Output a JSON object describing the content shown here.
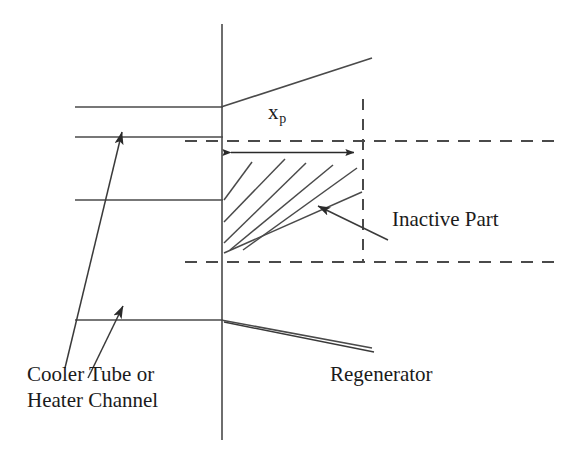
{
  "figure": {
    "kind": "engineering-schematic",
    "background_color": "#ffffff",
    "line_color": "#3a3a3a",
    "text_color": "#1b1b1b",
    "width": 579,
    "height": 460
  },
  "labels": {
    "xp_symbol": "x",
    "xp_subscript": "p",
    "inactive_part": "Inactive Part",
    "cooler_tube_line1": "Cooler Tube or",
    "cooler_tube_line2": "Heater Channel",
    "regenerator": "Regenerator"
  },
  "geometry": {
    "interface_line": {
      "x": 222,
      "y_top": 24,
      "y_bottom": 440
    },
    "channel_walls": [
      {
        "name": "wall-top-outer",
        "x1": 75,
        "y1": 107,
        "x2": 222,
        "y2": 107
      },
      {
        "name": "wall-top-inner",
        "x1": 75,
        "y1": 137,
        "x2": 222,
        "y2": 137
      },
      {
        "name": "wall-bottom-inner",
        "x1": 75,
        "y1": 200,
        "x2": 222,
        "y2": 200
      },
      {
        "name": "wall-bottom-outer",
        "x1": 75,
        "y1": 320,
        "x2": 222,
        "y2": 320
      }
    ],
    "regenerator_walls": [
      {
        "name": "regenerator-wall-upper",
        "x1": 222,
        "y1": 107,
        "x2": 372,
        "y2": 58
      },
      {
        "name": "regenerator-wall-lower",
        "x1": 222,
        "y1": 320,
        "x2": 372,
        "y2": 348
      }
    ],
    "dashed_horizontal_upper": {
      "y": 141,
      "x1": 185,
      "x2": 556
    },
    "dashed_horizontal_lower": {
      "y": 262,
      "x1": 185,
      "x2": 556
    },
    "dashed_vertical": {
      "x": 363,
      "y1": 99,
      "y2": 262
    },
    "dimension_arrow": {
      "y": 152,
      "x1": 222,
      "x2": 363,
      "double_headed": true
    },
    "hatch_lines": [
      {
        "x1": 224,
        "y1": 200,
        "x2": 251,
        "y2": 163
      },
      {
        "x1": 224,
        "y1": 218,
        "x2": 282,
        "y2": 160
      },
      {
        "x1": 224,
        "y1": 240,
        "x2": 302,
        "y2": 164
      },
      {
        "x1": 230,
        "y1": 248,
        "x2": 330,
        "y2": 166
      },
      {
        "x1": 238,
        "y1": 248,
        "x2": 355,
        "y2": 168
      },
      {
        "x1": 226,
        "y1": 252,
        "x2": 362,
        "y2": 190
      }
    ],
    "leader_inactive_part": {
      "from_x": 388,
      "from_y": 240,
      "to_x": 313,
      "to_y": 203
    },
    "leader_cooler_tube": {
      "from_x": 65,
      "from_y": 368,
      "to_x": 125,
      "to_y": 127
    },
    "leader_heater_channel": {
      "from_x": 90,
      "from_y": 378,
      "to_x": 127,
      "to_y": 302
    }
  }
}
